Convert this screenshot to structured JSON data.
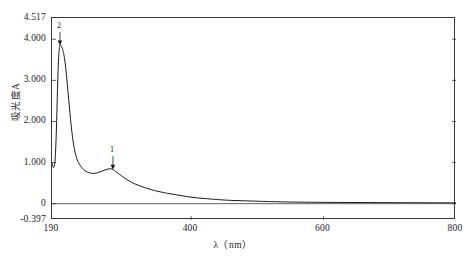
{
  "chart_data": {
    "type": "line",
    "title": "",
    "xlabel": "λ（nm）",
    "ylabel": "吸光度A",
    "xlim": [
      190,
      800
    ],
    "ylim": [
      -0.397,
      4.517
    ],
    "grid": false,
    "legend": "none",
    "xticks": [
      {
        "value": 190,
        "label": "190"
      },
      {
        "value": 400,
        "label": "400"
      },
      {
        "value": 600,
        "label": "600"
      },
      {
        "value": 800,
        "label": "800"
      }
    ],
    "yticks": [
      {
        "value": 4.517,
        "label": "4.517"
      },
      {
        "value": 4.0,
        "label": "4.000"
      },
      {
        "value": 3.0,
        "label": "3.000"
      },
      {
        "value": 2.0,
        "label": "2.000"
      },
      {
        "value": 1.0,
        "label": "1.000"
      },
      {
        "value": 0.0,
        "label": "0"
      },
      {
        "value": -0.397,
        "label": "-0.397"
      }
    ],
    "baseline": {
      "value": 0.0,
      "label": "0"
    },
    "annotations": [
      {
        "label": "2",
        "x": 202,
        "y": 3.86,
        "note": "main absorption peak marker with arrow"
      },
      {
        "label": "1",
        "x": 282,
        "y": 0.84,
        "note": "secondary shoulder peak marker with arrow"
      }
    ],
    "series": [
      {
        "name": "absorbance",
        "color": "#1a1a1a",
        "x": [
          190,
          192,
          194,
          195,
          196,
          197,
          198,
          199,
          200,
          201,
          202,
          203,
          204,
          205,
          206,
          207,
          208,
          210,
          212,
          214,
          216,
          218,
          220,
          222,
          224,
          226,
          228,
          230,
          233,
          236,
          240,
          245,
          250,
          255,
          260,
          265,
          270,
          274,
          278,
          281,
          284,
          288,
          293,
          300,
          310,
          320,
          330,
          340,
          350,
          365,
          380,
          395,
          410,
          425,
          440,
          460,
          480,
          500,
          520,
          550,
          580,
          620,
          660,
          700,
          750,
          800
        ],
        "y": [
          0.99,
          0.88,
          0.95,
          1.15,
          1.5,
          2.0,
          2.6,
          3.15,
          3.55,
          3.76,
          3.85,
          3.86,
          3.84,
          3.8,
          3.76,
          3.7,
          3.62,
          3.4,
          3.1,
          2.75,
          2.4,
          2.05,
          1.75,
          1.5,
          1.32,
          1.18,
          1.07,
          1.0,
          0.92,
          0.86,
          0.8,
          0.76,
          0.74,
          0.74,
          0.76,
          0.79,
          0.82,
          0.84,
          0.85,
          0.84,
          0.81,
          0.76,
          0.7,
          0.62,
          0.52,
          0.45,
          0.39,
          0.34,
          0.3,
          0.25,
          0.21,
          0.17,
          0.14,
          0.12,
          0.1,
          0.08,
          0.07,
          0.06,
          0.05,
          0.04,
          0.035,
          0.03,
          0.028,
          0.025,
          0.022,
          0.02
        ]
      }
    ]
  },
  "axis_titles": {
    "y": "吸光度A",
    "x": "λ（nm）"
  }
}
